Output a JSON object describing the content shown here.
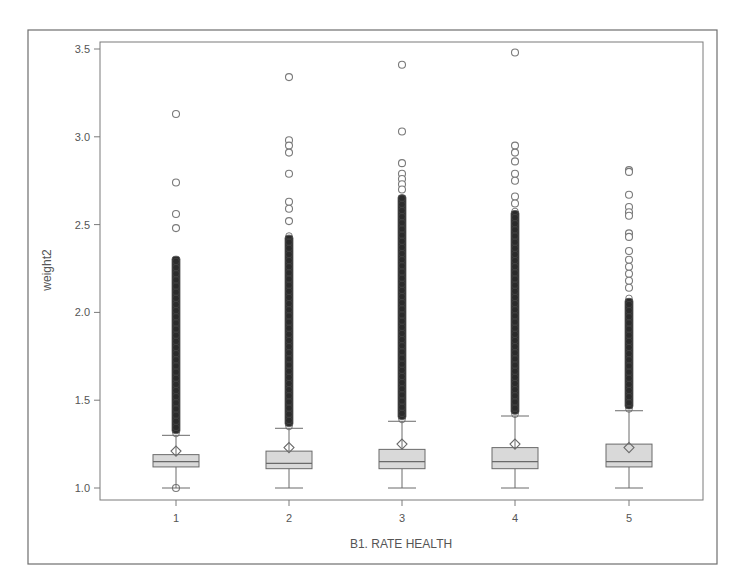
{
  "page": {
    "cropped_header_text": ""
  },
  "chart_data": {
    "type": "box",
    "title": "",
    "xlabel": "B1. RATE HEALTH",
    "ylabel": "weight2",
    "categories": [
      "1",
      "2",
      "3",
      "4",
      "5"
    ],
    "ylim": [
      0.94,
      3.55
    ],
    "yticks": [
      1.0,
      1.5,
      2.0,
      2.5,
      3.0,
      3.5
    ],
    "ytick_labels": [
      "1.0",
      "1.5",
      "2.0",
      "2.5",
      "3.0",
      "3.5"
    ],
    "grid": false,
    "legend": null,
    "series": [
      {
        "category": "1",
        "whisker_low": 1.0,
        "q1": 1.12,
        "median": 1.15,
        "q3": 1.19,
        "whisker_high": 1.3,
        "mean": 1.21,
        "outliers_sparse": [
          3.13,
          2.74,
          2.56,
          2.48,
          1.0
        ],
        "outlier_dense_range": [
          1.31,
          2.32
        ]
      },
      {
        "category": "2",
        "whisker_low": 1.0,
        "q1": 1.11,
        "median": 1.14,
        "q3": 1.21,
        "whisker_high": 1.34,
        "mean": 1.23,
        "outliers_sparse": [
          3.34,
          2.98,
          2.95,
          2.91,
          2.79,
          2.63,
          2.59,
          2.52
        ],
        "outlier_dense_range": [
          1.35,
          2.44
        ]
      },
      {
        "category": "3",
        "whisker_low": 1.0,
        "q1": 1.11,
        "median": 1.15,
        "q3": 1.22,
        "whisker_high": 1.38,
        "mean": 1.25,
        "outliers_sparse": [
          3.41,
          3.03,
          2.85,
          2.79,
          2.76,
          2.73,
          2.7
        ],
        "outlier_dense_range": [
          1.39,
          2.67
        ]
      },
      {
        "category": "4",
        "whisker_low": 1.0,
        "q1": 1.11,
        "median": 1.15,
        "q3": 1.23,
        "whisker_high": 1.41,
        "mean": 1.25,
        "outliers_sparse": [
          3.48,
          2.95,
          2.91,
          2.86,
          2.79,
          2.75,
          2.66,
          2.62
        ],
        "outlier_dense_range": [
          1.42,
          2.58
        ]
      },
      {
        "category": "5",
        "whisker_low": 1.0,
        "q1": 1.12,
        "median": 1.15,
        "q3": 1.25,
        "whisker_high": 1.44,
        "mean": 1.23,
        "outliers_sparse": [
          2.81,
          2.8,
          2.67,
          2.6,
          2.57,
          2.55,
          2.45,
          2.43,
          2.35,
          2.3,
          2.26,
          2.22,
          2.18,
          2.14
        ],
        "outlier_dense_range": [
          1.45,
          2.08
        ]
      }
    ]
  },
  "style": {
    "frame_color": "#6e6e6e",
    "axis_color": "#7a7a7a",
    "box_fill": "#d9d9d9",
    "box_stroke": "#6a6a6a",
    "outlier_stroke": "#7a7a7a",
    "dense_fill": "#2b2b2b"
  }
}
